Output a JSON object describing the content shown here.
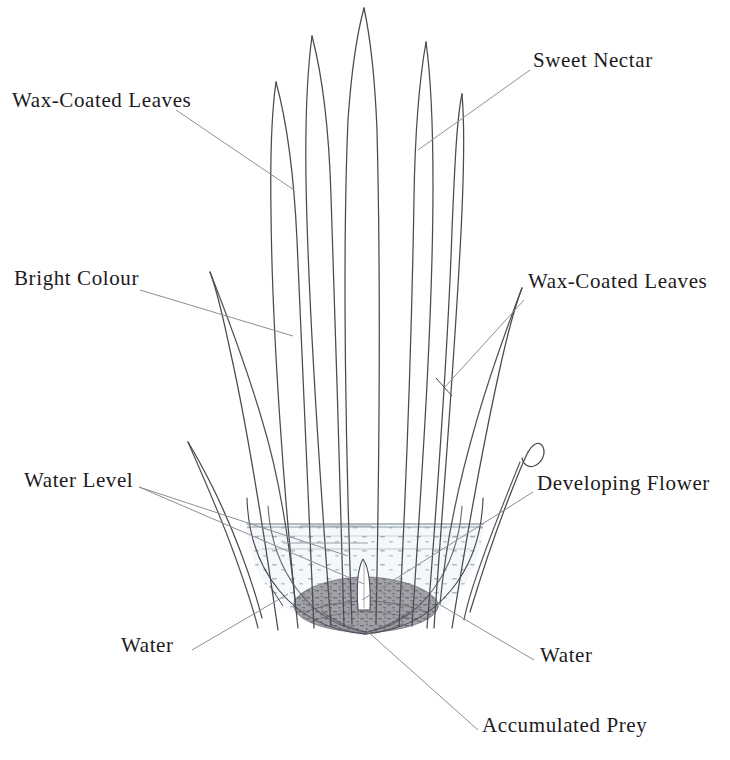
{
  "diagram": {
    "background_color": "#ffffff",
    "ink_color": "#4a4a52",
    "text_color": "#1c1a1c",
    "water_fill_color": "#f2f6f8",
    "water_stipple_color": "#93a7b4",
    "prey_color": "#6e6e74"
  },
  "labels": [
    {
      "id": "wax-coated-leaves-left",
      "text": "Wax-Coated Leaves",
      "x": 12,
      "y": 98,
      "align": "left"
    },
    {
      "id": "sweet-nectar",
      "text": "Sweet Nectar",
      "x": 533,
      "y": 58,
      "align": "left"
    },
    {
      "id": "bright-colour",
      "text": "Bright Colour",
      "x": 14,
      "y": 276,
      "align": "left"
    },
    {
      "id": "wax-coated-leaves-right",
      "text": "Wax-Coated Leaves",
      "x": 528,
      "y": 279,
      "align": "left"
    },
    {
      "id": "water-level",
      "text": "Water Level",
      "x": 24,
      "y": 478,
      "align": "left"
    },
    {
      "id": "developing-flower",
      "text": "Developing Flower",
      "x": 537,
      "y": 481,
      "align": "left"
    },
    {
      "id": "water-left",
      "text": "Water",
      "x": 121,
      "y": 643,
      "align": "left"
    },
    {
      "id": "water-right",
      "text": "Water",
      "x": 540,
      "y": 653,
      "align": "left"
    },
    {
      "id": "accumulated-prey",
      "text": "Accumulated Prey",
      "x": 482,
      "y": 723,
      "align": "left"
    }
  ],
  "parts": {
    "leaves_count": 9,
    "water_surface_y": 528,
    "tank_bottom_y": 632,
    "flower_bud": "white lance-shaped bud at tank centre",
    "prey_mass": "dark sediment at tank base"
  }
}
